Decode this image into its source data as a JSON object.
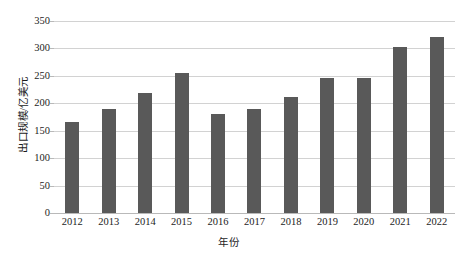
{
  "chart_data": {
    "type": "bar",
    "title": "",
    "xlabel": "年份",
    "ylabel": "出口规模/亿美元",
    "categories": [
      "2012",
      "2013",
      "2014",
      "2015",
      "2016",
      "2017",
      "2018",
      "2019",
      "2020",
      "2021",
      "2022"
    ],
    "values": [
      166,
      190,
      218,
      256,
      180,
      190,
      211,
      247,
      247,
      303,
      320
    ],
    "series": [
      {
        "name": "出口规模",
        "values": [
          166,
          190,
          218,
          256,
          180,
          190,
          211,
          247,
          247,
          303,
          320
        ]
      }
    ],
    "ylim": [
      0,
      350
    ],
    "ytick_labels": [
      "0",
      "50",
      "100",
      "150",
      "200",
      "250",
      "300",
      "350"
    ],
    "ytick_values": [
      0,
      50,
      100,
      150,
      200,
      250,
      300,
      350
    ],
    "grid": "horizontal",
    "legend": "none",
    "colors": {
      "bar": "#595959",
      "gridline": "#d2d2d2",
      "axis": "#b9b9b9",
      "text": "#1d1d1d",
      "background": "#ffffff"
    }
  }
}
